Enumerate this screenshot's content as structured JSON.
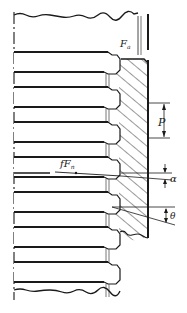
{
  "diagram": {
    "colors": {
      "line": "#1a1a1a",
      "hatch": "#333333",
      "background": "#ffffff"
    },
    "labels": {
      "axial_force": {
        "main": "F",
        "sub": "a"
      },
      "pitch": "P",
      "friction_force": {
        "main": "fF",
        "sub": "n"
      },
      "lead_angle": "α",
      "flank_angle": "θ"
    },
    "parts": {
      "screw": "screw (threaded rod, left)",
      "nut": "nut (hatched section, right)",
      "centerline": "axis centerline (dashed)"
    },
    "thread_count": 7
  }
}
